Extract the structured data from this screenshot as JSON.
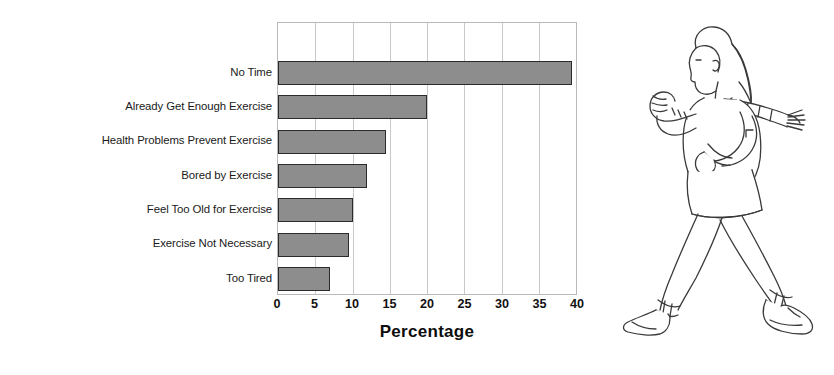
{
  "figure": {
    "background_color": "#ffffff"
  },
  "chart_data": {
    "type": "bar",
    "orientation": "horizontal",
    "title": "",
    "subtitle": "",
    "xlabel": "Percentage",
    "ylabel": "",
    "categories": [
      "No Time",
      "Already Get Enough Exercise",
      "Health Problems Prevent Exercise",
      "Bored by Exercise",
      "Feel Too Old for Exercise",
      "Exercise Not Necessary",
      "Too Tired"
    ],
    "values": [
      39.5,
      20,
      14.5,
      12,
      10,
      9.5,
      7
    ],
    "xlim": [
      0,
      40
    ],
    "xticks": [
      0,
      5,
      10,
      15,
      20,
      25,
      30,
      35,
      40
    ],
    "xtick_labels": [
      "0",
      "5",
      "10",
      "15",
      "20",
      "25",
      "30",
      "35",
      "40"
    ],
    "grid": "vertical",
    "legend": "none",
    "bar_fill_color": "#8d8d8d",
    "bar_edge_color": "#2b2b2b",
    "gridline_color": "#c9c9c9",
    "axis_border_color": "#b9b9b9"
  },
  "illustration": {
    "name": "walking-woman-line-art",
    "description": "Line drawing of a woman power-walking to the left with long ponytail, sweater, skirt and boots",
    "stroke_color": "#3a3a3a",
    "fill_color": "#ffffff"
  }
}
